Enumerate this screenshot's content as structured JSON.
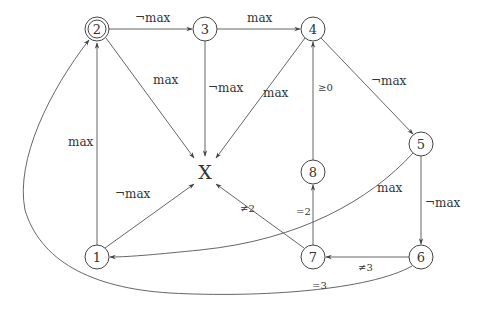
{
  "diagram": {
    "type": "state-transition-graph",
    "nodes": [
      {
        "id": "2",
        "label": "2",
        "x": 97,
        "y": 29,
        "accepting": true
      },
      {
        "id": "3",
        "label": "3",
        "x": 205,
        "y": 29
      },
      {
        "id": "4",
        "label": "4",
        "x": 313,
        "y": 29
      },
      {
        "id": "X",
        "label": "X",
        "x": 205,
        "y": 172,
        "plain": true
      },
      {
        "id": "8",
        "label": "8",
        "x": 313,
        "y": 172
      },
      {
        "id": "5",
        "label": "5",
        "x": 421,
        "y": 144
      },
      {
        "id": "1",
        "label": "1",
        "x": 97,
        "y": 257
      },
      {
        "id": "7",
        "label": "7",
        "x": 313,
        "y": 257
      },
      {
        "id": "6",
        "label": "6",
        "x": 421,
        "y": 257
      }
    ],
    "edges": [
      {
        "from": "2",
        "to": "3",
        "label": "¬max"
      },
      {
        "from": "3",
        "to": "4",
        "label": "max"
      },
      {
        "from": "2",
        "to": "X",
        "label": "max"
      },
      {
        "from": "3",
        "to": "X",
        "label": "¬max"
      },
      {
        "from": "4",
        "to": "X",
        "label": "max"
      },
      {
        "from": "4",
        "to": "5",
        "label": "¬max"
      },
      {
        "from": "8",
        "to": "4",
        "label": "≥0"
      },
      {
        "from": "7",
        "to": "8",
        "label": "=2"
      },
      {
        "from": "7",
        "to": "X",
        "label": "≠2"
      },
      {
        "from": "1",
        "to": "X",
        "label": "¬max"
      },
      {
        "from": "1",
        "to": "2",
        "label": "max"
      },
      {
        "from": "5",
        "to": "1",
        "label": "max"
      },
      {
        "from": "5",
        "to": "6",
        "label": "¬max"
      },
      {
        "from": "6",
        "to": "7",
        "label": "≠3"
      },
      {
        "from": "6",
        "to": "2",
        "label": "=3"
      }
    ]
  },
  "labels": {
    "n1": "1",
    "n2": "2",
    "n3": "3",
    "n4": "4",
    "n5": "5",
    "n6": "6",
    "n7": "7",
    "n8": "8",
    "nX": "X",
    "e_2_3": "¬max",
    "e_3_4": "max",
    "e_2_X": "max",
    "e_3_X": "¬max",
    "e_4_X": "max",
    "e_4_5": "¬max",
    "e_8_4": "≥0",
    "e_7_8": "=2",
    "e_7_X": "≠2",
    "e_1_X": "¬max",
    "e_1_2": "max",
    "e_5_1": "max",
    "e_5_6": "¬max",
    "e_6_7": "≠3",
    "e_6_2": "=3"
  },
  "colors": {
    "background": "#ffffff",
    "stroke": "#444444",
    "text": "#333333"
  }
}
